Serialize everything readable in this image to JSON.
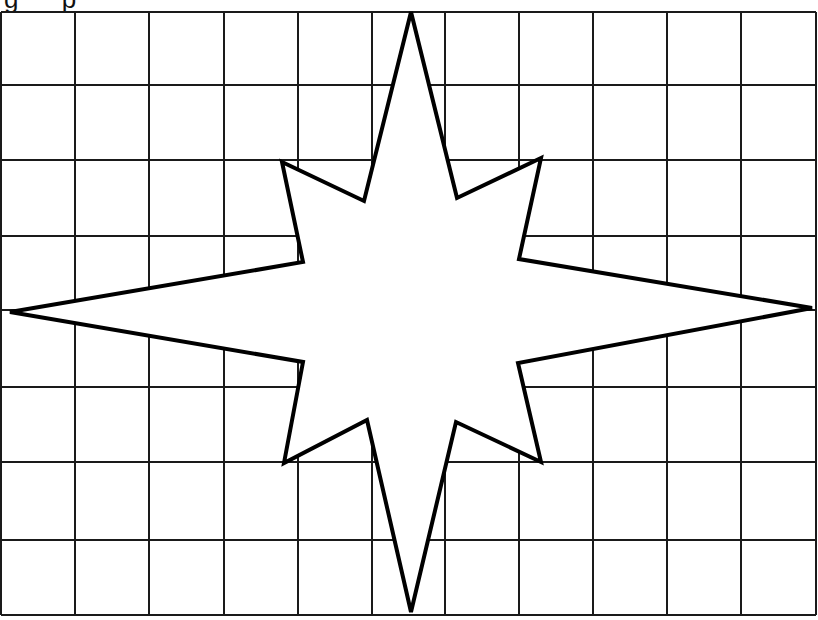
{
  "caption": "g p",
  "grid": {
    "columns": 11,
    "rows": 8,
    "x_lines": [
      1,
      75,
      149,
      224,
      298,
      372,
      445,
      519,
      593,
      667,
      741,
      816
    ],
    "y_lines": [
      12,
      85,
      160,
      236,
      310,
      387,
      462,
      540,
      615
    ],
    "line_color": "#1a1a1a"
  },
  "star": {
    "points": "411,12 457,198 541,158 519,259 812,308 518,363 541,462 456,422 411,612 367,420 284,463 303,362 10,312 303,262 282,162 364,201",
    "stroke": "#000000",
    "fill": "#ffffff",
    "stroke_width": 4
  }
}
